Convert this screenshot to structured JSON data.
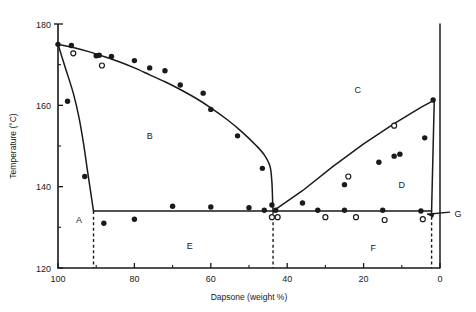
{
  "chart_data": {
    "type": "line",
    "title": "",
    "xlabel": "Dapsone (weight %)",
    "ylabel": "Temperature (°C)",
    "xlim": [
      100,
      0
    ],
    "ylim": [
      120,
      180
    ],
    "x_ticks_major": [
      100,
      80,
      60,
      40,
      20,
      0
    ],
    "x_ticks_minor": [
      90,
      70,
      50,
      30,
      10
    ],
    "y_ticks_major": [
      120,
      140,
      160,
      180
    ],
    "y_ticks_minor": [
      130,
      150,
      170
    ],
    "x_axis_reversed": true,
    "grid": false,
    "legend": null,
    "region_labels": [
      {
        "label": "A",
        "x": 94.5,
        "y": 132.0
      },
      {
        "label": "B",
        "x": 76.0,
        "y": 152.5
      },
      {
        "label": "C",
        "x": 21.5,
        "y": 164.0
      },
      {
        "label": "D",
        "x": 10.0,
        "y": 140.5
      },
      {
        "label": "E",
        "x": 65.5,
        "y": 125.5
      },
      {
        "label": "F",
        "x": 17.5,
        "y": 125.0
      },
      {
        "label": "G",
        "x": 1.5,
        "y": 133.5
      }
    ],
    "annotations": [
      {
        "text": "G",
        "points_to": "narrow-solid-solution-region-near-0-percent"
      }
    ],
    "series": [
      {
        "name": "left liquidus",
        "style": "solid-curve",
        "points": [
          [
            100,
            175.0
          ],
          [
            96,
            174.2
          ],
          [
            92,
            173.2
          ],
          [
            88,
            172.0
          ],
          [
            84,
            170.7
          ],
          [
            80,
            169.2
          ],
          [
            76,
            167.5
          ],
          [
            72,
            165.8
          ],
          [
            68,
            163.9
          ],
          [
            64,
            161.8
          ],
          [
            60,
            159.4
          ],
          [
            56,
            156.7
          ],
          [
            52,
            153.6
          ],
          [
            48,
            150.0
          ],
          [
            46,
            147.8
          ],
          [
            44.5,
            145.0
          ],
          [
            44,
            141.0
          ],
          [
            43.8,
            136.0
          ],
          [
            43.7,
            134.0
          ]
        ]
      },
      {
        "name": "left solidus",
        "style": "solid-curve",
        "points": [
          [
            100,
            175.0
          ],
          [
            98,
            169.0
          ],
          [
            96,
            163.0
          ],
          [
            94.5,
            157.0
          ],
          [
            93.3,
            150.5
          ],
          [
            92.3,
            144.0
          ],
          [
            91.5,
            139.0
          ],
          [
            91.0,
            135.8
          ],
          [
            90.7,
            134.0
          ]
        ]
      },
      {
        "name": "right liquidus",
        "style": "solid-line",
        "points": [
          [
            43.7,
            134.0
          ],
          [
            36,
            139.0
          ],
          [
            28,
            145.0
          ],
          [
            20,
            150.5
          ],
          [
            12,
            155.5
          ],
          [
            5,
            159.5
          ],
          [
            1.5,
            161.3
          ]
        ]
      },
      {
        "name": "right steep solidus",
        "style": "solid-line",
        "points": [
          [
            1.5,
            161.3
          ],
          [
            2.2,
            134.0
          ]
        ]
      },
      {
        "name": "eutectic horizontal",
        "style": "solid-line",
        "points": [
          [
            90.7,
            134.0
          ],
          [
            2.2,
            134.0
          ]
        ]
      },
      {
        "name": "right boundary",
        "style": "solid-line",
        "points": [
          [
            0,
            180.0
          ],
          [
            0,
            161.3
          ],
          [
            0,
            120.0
          ]
        ]
      }
    ],
    "dashed_lines": [
      {
        "name": "left eutectic vertical",
        "x": 90.7,
        "y_from": 134.0,
        "y_to": 120.0
      },
      {
        "name": "eutectic vertical",
        "x": 43.7,
        "y_from": 134.0,
        "y_to": 120.0
      },
      {
        "name": "right vertical",
        "x": 2.2,
        "y_from": 134.0,
        "y_to": 120.0
      }
    ],
    "filled_points": [
      [
        100,
        175.0
      ],
      [
        96.5,
        174.7
      ],
      [
        90.0,
        172.2
      ],
      [
        89.2,
        172.3
      ],
      [
        86.0,
        172.0
      ],
      [
        80.0,
        171.0
      ],
      [
        72.0,
        168.5
      ],
      [
        62.0,
        163.0
      ],
      [
        97.5,
        161.0
      ],
      [
        93.0,
        142.5
      ],
      [
        76.0,
        169.2
      ],
      [
        68.0,
        165.0
      ],
      [
        60.0,
        159.0
      ],
      [
        53.0,
        152.5
      ],
      [
        46.5,
        144.5
      ],
      [
        44.0,
        135.5
      ],
      [
        43.0,
        134.2
      ],
      [
        88.0,
        131.0
      ],
      [
        80.0,
        132.0
      ],
      [
        70.0,
        135.2
      ],
      [
        60.0,
        135.0
      ],
      [
        50.0,
        134.8
      ],
      [
        46.0,
        134.2
      ],
      [
        36.0,
        136.0
      ],
      [
        25.0,
        140.5
      ],
      [
        16.0,
        146.0
      ],
      [
        12.0,
        147.5
      ],
      [
        10.5,
        148.0
      ],
      [
        4.0,
        152.0
      ],
      [
        1.8,
        161.3
      ],
      [
        32.0,
        134.2
      ],
      [
        25.0,
        134.2
      ],
      [
        15.0,
        134.2
      ],
      [
        5.0,
        134.0
      ]
    ],
    "open_points": [
      [
        96.0,
        172.8
      ],
      [
        88.5,
        169.8
      ],
      [
        44.0,
        132.5
      ],
      [
        42.5,
        132.5
      ],
      [
        30.0,
        132.5
      ],
      [
        24.0,
        142.5
      ],
      [
        22.0,
        132.5
      ],
      [
        14.5,
        131.8
      ],
      [
        12.0,
        155.0
      ],
      [
        4.5,
        132.0
      ]
    ]
  },
  "axis": {
    "x_title": "Dapsone (weight %)",
    "y_title": "Temperature (°C)",
    "x_tick_labels": [
      "100",
      "80",
      "60",
      "40",
      "20",
      "0"
    ],
    "y_tick_labels": [
      "180",
      "160",
      "140",
      "120"
    ]
  },
  "colors": {
    "ink": "#1a1a1a",
    "background": "#ffffff"
  }
}
